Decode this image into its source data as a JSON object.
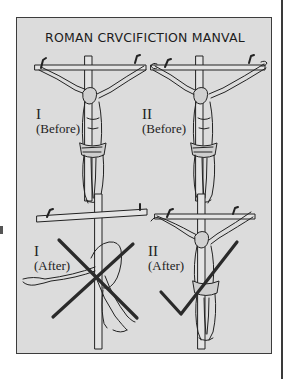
{
  "illustration": {
    "title": "ROMAN CRVCIFICTION MANVAL",
    "panels": [
      {
        "numeral": "I",
        "caption": "(Before)",
        "mark": "none"
      },
      {
        "numeral": "II",
        "caption": "(Before)",
        "mark": "none"
      },
      {
        "numeral": "I",
        "caption": "(After)",
        "mark": "cross-x"
      },
      {
        "numeral": "II",
        "caption": "(After)",
        "mark": "checkmark"
      }
    ],
    "colors": {
      "panel_background": "#dcdcdc",
      "ink": "#222222",
      "mark": "#2a2a2a"
    }
  }
}
